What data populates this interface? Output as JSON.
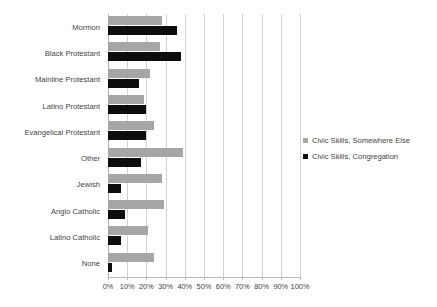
{
  "chart_data": {
    "type": "bar",
    "orientation": "horizontal",
    "title": "",
    "subtitle": "",
    "xlabel": "",
    "ylabel": "",
    "xlim": [
      0,
      100
    ],
    "xtick_step": 10,
    "grid": true,
    "legend_position": "right",
    "categories": [
      "Mormon",
      "Black Protestant",
      "Mainline Protestant",
      "Latino Protestant",
      "Evangelical Protestant",
      "Other",
      "Jewish",
      "Anglo Catholic",
      "Latino Catholic",
      "None"
    ],
    "tick_labels": [
      "0%",
      "10%",
      "20%",
      "30%",
      "40%",
      "50%",
      "60%",
      "70%",
      "80%",
      "90%",
      "100%"
    ],
    "series": [
      {
        "name": "Civic Skills, Somewhere Else",
        "color": "#a6a6a6",
        "values": [
          28,
          27,
          22,
          19,
          24,
          39,
          28,
          29,
          21,
          24
        ]
      },
      {
        "name": "Civic Skills, Congregation",
        "color": "#0d0d0d",
        "values": [
          36,
          38,
          16,
          20,
          20,
          17,
          7,
          9,
          7,
          2
        ]
      }
    ]
  },
  "legend": {
    "items": [
      {
        "label": "Civic Skills, Somewhere Else",
        "swatch": "gray"
      },
      {
        "label": "Civic Skills, Congregation",
        "swatch": "black"
      }
    ]
  }
}
